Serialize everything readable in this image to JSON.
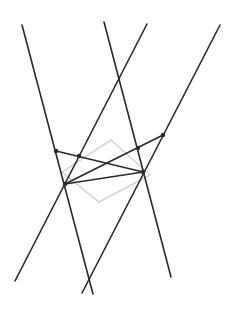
{
  "diagram": {
    "width": 235,
    "height": 316,
    "background": "#ffffff",
    "line_color": "#2a2a2a",
    "line_width": 1.6,
    "shape_color": "#d4d4d4",
    "shape_width": 1.5,
    "point_color": "#2a2a2a",
    "point_radius": 2.2,
    "lines": [
      {
        "id": "line-1",
        "x1": 22,
        "y1": 25,
        "x2": 93,
        "y2": 294
      },
      {
        "id": "line-2",
        "x1": 147,
        "y1": 24,
        "x2": 15,
        "y2": 281
      },
      {
        "id": "line-3",
        "x1": 104,
        "y1": 22,
        "x2": 171,
        "y2": 277
      },
      {
        "id": "line-4",
        "x1": 220,
        "y1": 25,
        "x2": 82,
        "y2": 293
      },
      {
        "id": "segment-a",
        "x1": 56,
        "y1": 151,
        "x2": 143,
        "y2": 172
      },
      {
        "id": "segment-b",
        "x1": 65,
        "y1": 184,
        "x2": 163,
        "y2": 135
      },
      {
        "id": "segment-c",
        "x1": 65,
        "y1": 184,
        "x2": 143,
        "y2": 172
      }
    ],
    "diamond": [
      {
        "x": 111,
        "y": 140
      },
      {
        "x": 150,
        "y": 175
      },
      {
        "x": 99,
        "y": 202
      },
      {
        "x": 62,
        "y": 172
      }
    ],
    "points": [
      {
        "id": "p1",
        "x": 56,
        "y": 151
      },
      {
        "id": "p2",
        "x": 79,
        "y": 156
      },
      {
        "id": "p3",
        "x": 138,
        "y": 148
      },
      {
        "id": "p4",
        "x": 163,
        "y": 135
      },
      {
        "id": "p5",
        "x": 65,
        "y": 184
      },
      {
        "id": "p6",
        "x": 143,
        "y": 172
      }
    ]
  }
}
